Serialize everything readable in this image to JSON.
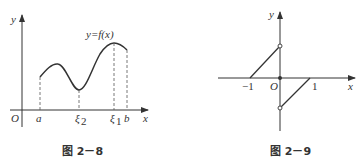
{
  "figures": [
    {
      "caption": "图 2－8",
      "axis_labels": {
        "x": "x",
        "y": "y",
        "origin": "O"
      },
      "curve_label": "y=f(x)",
      "x_ticks": [
        "a",
        "ξ",
        "ξ",
        "b"
      ],
      "x_tick_subscripts": [
        "",
        "2",
        "1",
        ""
      ]
    },
    {
      "caption": "图 2－9",
      "axis_labels": {
        "x": "x",
        "y": "y",
        "origin": "O"
      },
      "x_ticks": [
        "−1",
        "1"
      ]
    }
  ],
  "colors": {
    "stroke": "#333333"
  }
}
